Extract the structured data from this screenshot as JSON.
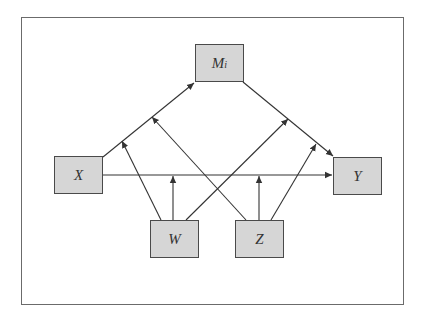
{
  "diagram": {
    "nodes": {
      "M": {
        "label": "M",
        "subscript": "i"
      },
      "X": {
        "label": "X"
      },
      "Y": {
        "label": "Y"
      },
      "W": {
        "label": "W"
      },
      "Z": {
        "label": "Z"
      }
    },
    "edges": [
      {
        "from": "X",
        "to": "M_i"
      },
      {
        "from": "M_i",
        "to": "Y"
      },
      {
        "from": "X",
        "to": "Y"
      },
      {
        "from": "W",
        "to": "X→M_i path"
      },
      {
        "from": "W",
        "to": "X→Y path"
      },
      {
        "from": "W",
        "to": "M_i→Y path"
      },
      {
        "from": "Z",
        "to": "X→M_i path"
      },
      {
        "from": "Z",
        "to": "X→Y path"
      },
      {
        "from": "Z",
        "to": "M_i→Y path"
      }
    ],
    "colors": {
      "node_fill": "#d6d6d6",
      "node_border": "#4a4a4a",
      "line": "#333333",
      "frame": "#6b6b6b"
    }
  }
}
